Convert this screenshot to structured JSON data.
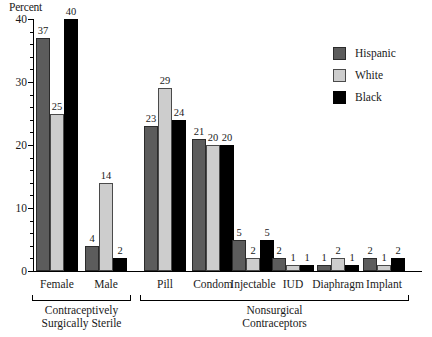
{
  "chart_data": {
    "type": "bar",
    "title": "",
    "xlabel": "",
    "ylabel": "Percent",
    "ylim": [
      0,
      40
    ],
    "yticks": [
      0,
      10,
      20,
      30,
      40
    ],
    "ytick_labels": [
      "0",
      "10",
      "20",
      "30",
      "40"
    ],
    "minor_tick_step": 2,
    "grid": false,
    "legend_position": "top-right",
    "categories": [
      "Female",
      "Male",
      "Pill",
      "Condom",
      "Injectable",
      "IUD",
      "Diaphragm",
      "Implant"
    ],
    "series": [
      {
        "name": "Hispanic",
        "color": "#5c5c5c",
        "values": [
          37,
          4,
          23,
          21,
          5,
          2,
          1,
          2
        ]
      },
      {
        "name": "White",
        "color": "#cdcdcd",
        "values": [
          25,
          14,
          29,
          20,
          2,
          1,
          2,
          1
        ]
      },
      {
        "name": "Black",
        "color": "#000000",
        "values": [
          40,
          2,
          24,
          20,
          5,
          1,
          1,
          2
        ]
      }
    ],
    "groups": [
      {
        "label": "Contraceptively\nSurgically Sterile",
        "line1": "Contraceptively",
        "line2": "Surgically Sterile",
        "categories": [
          "Female",
          "Male"
        ]
      },
      {
        "label": "Nonsurgical\nContraceptors",
        "line1": "Nonsurgical",
        "line2": "Contraceptors",
        "categories": [
          "Pill",
          "Condom",
          "Injectable",
          "IUD",
          "Diaphragm",
          "Implant"
        ]
      }
    ]
  },
  "legend": {
    "items": [
      {
        "label": "Hispanic",
        "swatch": "hispanic"
      },
      {
        "label": "White",
        "swatch": "white"
      },
      {
        "label": "Black",
        "swatch": "black"
      }
    ]
  }
}
